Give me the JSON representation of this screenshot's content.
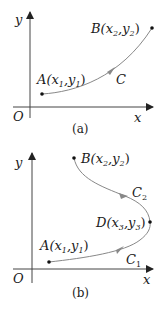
{
  "figures": [
    {
      "id": "a",
      "caption": "(a)",
      "axes": {
        "x_label": "x",
        "y_label": "y",
        "origin_label": "O"
      },
      "points": [
        {
          "name": "A",
          "label": "A(x",
          "sub1": "1",
          "mid": ",y",
          "sub2": "1",
          "end": ")"
        },
        {
          "name": "B",
          "label": "B(x",
          "sub1": "2",
          "mid": ",y",
          "sub2": "2",
          "end": ")"
        }
      ],
      "curves": [
        {
          "label": "C",
          "sub": ""
        }
      ]
    },
    {
      "id": "b",
      "caption": "(b)",
      "axes": {
        "x_label": "x",
        "y_label": "y",
        "origin_label": "O"
      },
      "points": [
        {
          "name": "A",
          "label": "A(x",
          "sub1": "1",
          "mid": ",y",
          "sub2": "1",
          "end": ")"
        },
        {
          "name": "B",
          "label": "B(x",
          "sub1": "2",
          "mid": ",y",
          "sub2": "2",
          "end": ")"
        },
        {
          "name": "D",
          "label": "D(x",
          "sub1": "3",
          "mid": ",y",
          "sub2": "3",
          "end": ")"
        }
      ],
      "curves": [
        {
          "label": "C",
          "sub": "1"
        },
        {
          "label": "C",
          "sub": "2"
        }
      ]
    }
  ],
  "colors": {
    "axis": "#333333",
    "curve": "#777777",
    "point": "#111111"
  }
}
